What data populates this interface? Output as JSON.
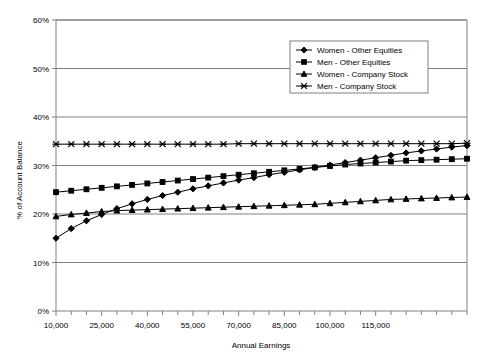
{
  "chart_data": {
    "type": "line",
    "title": "",
    "xlabel": "Annual Earnings",
    "ylabel": "% of Account Balance",
    "xlim": [
      10000,
      145000
    ],
    "ylim": [
      0,
      60
    ],
    "ytick_labels": [
      "0%",
      "10%",
      "20%",
      "30%",
      "40%",
      "50%",
      "60%"
    ],
    "ytick_values": [
      0,
      10,
      20,
      30,
      40,
      50,
      60
    ],
    "xtick_labels": [
      "10,000",
      "25,000",
      "40,000",
      "55,000",
      "70,000",
      "85,000",
      "100,000",
      "115,000"
    ],
    "xtick_label_values": [
      10000,
      25000,
      40000,
      55000,
      70000,
      85000,
      100000,
      115000
    ],
    "x": [
      10000,
      15000,
      20000,
      25000,
      30000,
      35000,
      40000,
      45000,
      50000,
      55000,
      60000,
      65000,
      70000,
      75000,
      80000,
      85000,
      90000,
      95000,
      100000,
      105000,
      110000,
      115000,
      120000,
      125000,
      130000,
      135000,
      140000,
      145000
    ],
    "grid": "horizontal",
    "legend_position": "top-right",
    "series": [
      {
        "name": "Women - Other Equities",
        "marker": "diamond",
        "values": [
          15.0,
          17.0,
          18.6,
          19.9,
          21.1,
          22.1,
          23.0,
          23.8,
          24.5,
          25.2,
          25.8,
          26.4,
          27.0,
          27.5,
          28.1,
          28.6,
          29.1,
          29.6,
          30.1,
          30.6,
          31.1,
          31.6,
          32.1,
          32.6,
          33.0,
          33.4,
          33.8,
          34.1
        ]
      },
      {
        "name": "Men - Other Equities",
        "marker": "square",
        "values": [
          24.5,
          24.8,
          25.1,
          25.4,
          25.7,
          26.0,
          26.3,
          26.6,
          26.9,
          27.2,
          27.5,
          27.8,
          28.1,
          28.4,
          28.7,
          29.0,
          29.3,
          29.6,
          29.9,
          30.2,
          30.4,
          30.6,
          30.8,
          31.0,
          31.1,
          31.2,
          31.3,
          31.4
        ]
      },
      {
        "name": "Women - Company Stock",
        "marker": "triangle",
        "values": [
          19.5,
          19.9,
          20.2,
          20.5,
          20.7,
          20.8,
          20.9,
          21.0,
          21.1,
          21.2,
          21.3,
          21.4,
          21.5,
          21.6,
          21.7,
          21.8,
          21.9,
          22.0,
          22.2,
          22.4,
          22.6,
          22.8,
          23.0,
          23.1,
          23.2,
          23.3,
          23.4,
          23.5
        ]
      },
      {
        "name": "Men - Company Stock",
        "marker": "cross",
        "values": [
          34.4,
          34.4,
          34.4,
          34.4,
          34.4,
          34.4,
          34.4,
          34.4,
          34.4,
          34.4,
          34.4,
          34.4,
          34.5,
          34.5,
          34.5,
          34.5,
          34.5,
          34.5,
          34.5,
          34.5,
          34.5,
          34.5,
          34.5,
          34.5,
          34.5,
          34.5,
          34.5,
          34.6
        ]
      }
    ]
  },
  "legend": {
    "items": [
      {
        "label": "Women - Other Equities"
      },
      {
        "label": "Men - Other Equities"
      },
      {
        "label": "Women - Company Stock"
      },
      {
        "label": "Men - Company Stock"
      }
    ]
  },
  "colors": {
    "series": "#000000",
    "axis": "#808080",
    "grid": "#808080",
    "background": "#ffffff"
  }
}
